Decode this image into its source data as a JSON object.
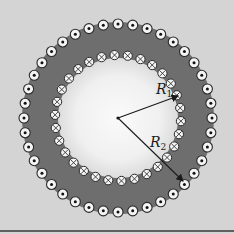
{
  "figure": {
    "center": [
      118,
      118
    ],
    "colors": {
      "background": "#d4d4d4",
      "band": "#6e6e6e",
      "inner_disk_center": "#fafafa",
      "inner_disk_edge": "#dcdcdc",
      "wire_fill": "#f4f4f4",
      "wire_stroke": "#2a2a2a",
      "baseline": "#3a3a3a"
    },
    "outer_ring": {
      "symbol": "dot",
      "meaning": "current out of page",
      "radius": 94,
      "count": 40,
      "wire_radius": 5
    },
    "inner_ring": {
      "symbol": "cross",
      "meaning": "current into page",
      "radius": 63,
      "count": 30,
      "wire_radius": 4.6
    },
    "band": {
      "inner_radius": 60,
      "outer_radius": 96
    },
    "radii": [
      {
        "name": "R",
        "subscript": "1",
        "end": [
          178,
          96
        ],
        "label_pos": [
          156,
          94
        ]
      },
      {
        "name": "R",
        "subscript": "2",
        "end": [
          183,
          181
        ],
        "label_pos": [
          150,
          147
        ]
      }
    ]
  }
}
